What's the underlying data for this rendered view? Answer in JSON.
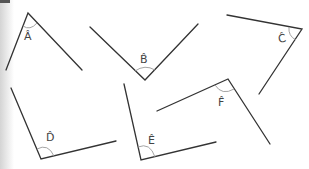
{
  "diagram": {
    "type": "angle-set",
    "colors": {
      "line": "#333333",
      "arc": "#9a9a9a",
      "label": "#444444",
      "background": "#ffffff"
    },
    "angles": [
      {
        "id": "A",
        "label": "Â",
        "vertex": [
          28,
          13
        ],
        "arm1": [
          6,
          70
        ],
        "arm2": [
          82,
          70
        ]
      },
      {
        "id": "B",
        "label": "B̂",
        "vertex": [
          145,
          80
        ],
        "arm1": [
          90,
          27
        ],
        "arm2": [
          198,
          24
        ]
      },
      {
        "id": "C",
        "label": "Ĉ",
        "vertex": [
          302,
          29
        ],
        "arm1": [
          227,
          15
        ],
        "arm2": [
          259,
          94
        ]
      },
      {
        "id": "D",
        "label": "D̂",
        "vertex": [
          41,
          159
        ],
        "arm1": [
          11,
          88
        ],
        "arm2": [
          116,
          141
        ]
      },
      {
        "id": "E",
        "label": "Ê",
        "vertex": [
          141,
          160
        ],
        "arm1": [
          124,
          84
        ],
        "arm2": [
          216,
          142
        ]
      },
      {
        "id": "F",
        "label": "F̂",
        "vertex": [
          228,
          79
        ],
        "arm1": [
          157,
          111
        ],
        "arm2": [
          270,
          144
        ]
      }
    ]
  }
}
